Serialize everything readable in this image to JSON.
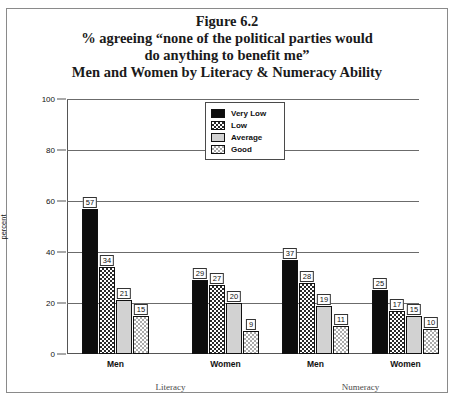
{
  "figure": {
    "title_lines": [
      "Figure 6.2",
      "% agreeing “none of the political parties would",
      "do anything to benefit me”",
      "Men and Women by Literacy & Numeracy Ability"
    ]
  },
  "legend": {
    "items": [
      {
        "label": "Very Low",
        "swatch": "solid-black-swatch",
        "color": "#0d0d0d"
      },
      {
        "label": "Low",
        "swatch": "checkered-dark-swatch",
        "color": "#2a2a2a"
      },
      {
        "label": "Average",
        "swatch": "solid-lightgray-swatch",
        "color": "#d2d2d2"
      },
      {
        "label": "Good",
        "swatch": "checkered-light-swatch",
        "color": "#aaaaaa"
      }
    ]
  },
  "axis": {
    "y_title": "percent",
    "y_ticks": [
      "0",
      "20",
      "40",
      "60",
      "80",
      "100"
    ]
  },
  "panels": [
    {
      "label": "Literacy"
    },
    {
      "label": "Numeracy"
    }
  ],
  "groups": [
    {
      "label": "Men",
      "panel": "Literacy"
    },
    {
      "label": "Women",
      "panel": "Literacy"
    },
    {
      "label": "Men",
      "panel": "Numeracy"
    },
    {
      "label": "Women",
      "panel": "Numeracy"
    }
  ],
  "chart_data": {
    "type": "bar",
    "xlabel": "",
    "ylabel": "percent",
    "ylim": [
      0,
      100
    ],
    "ytick_step": 20,
    "grid": true,
    "grid_axis": "y",
    "legend_position": "top-center",
    "categories": [
      "Men (Literacy)",
      "Women (Literacy)",
      "Men (Numeracy)",
      "Women (Numeracy)"
    ],
    "panel_groups": [
      {
        "panel": "Literacy",
        "categories": [
          "Men",
          "Women"
        ]
      },
      {
        "panel": "Numeracy",
        "categories": [
          "Men",
          "Women"
        ]
      }
    ],
    "series": [
      {
        "name": "Very Low",
        "values": [
          57,
          29,
          37,
          25
        ]
      },
      {
        "name": "Low",
        "values": [
          34,
          27,
          28,
          17
        ]
      },
      {
        "name": "Average",
        "values": [
          21,
          20,
          19,
          15
        ]
      },
      {
        "name": "Good",
        "values": [
          15,
          9,
          11,
          10
        ]
      }
    ],
    "data_labels": true
  }
}
